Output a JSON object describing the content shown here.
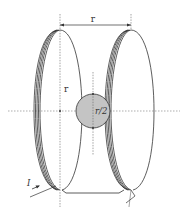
{
  "figure": {
    "labels": {
      "coil_separation": "r",
      "coil_radius": "r",
      "sphere_radius": "r/2",
      "current": "I"
    }
  },
  "colors": {
    "stroke": "#333333",
    "axis": "#666666",
    "sphere_fill": "#c4c4c4",
    "background": "#ffffff"
  }
}
